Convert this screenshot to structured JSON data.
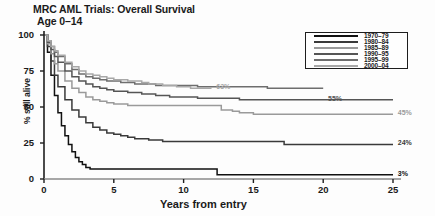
{
  "chart_data": {
    "type": "line",
    "title": "MRC AML Trials: Overall Survival",
    "subtitle": "Age 0–14",
    "xlabel": "Years from entry",
    "ylabel": "% still alive",
    "xlim": [
      0,
      25
    ],
    "ylim": [
      0,
      100
    ],
    "xticks": [
      "0",
      "5",
      "10",
      "15",
      "20",
      "25"
    ],
    "yticks": [
      "0",
      "25",
      "50",
      "75",
      "100"
    ],
    "grid": false,
    "legend_position": "top-right",
    "curve_type": "kaplan-meier-step",
    "legend": [
      "1970–79",
      "1980–84",
      "1985–89",
      "1990–95",
      "1995–99",
      "2000–04"
    ],
    "series": [
      {
        "name": "1970–79",
        "color": "#111111",
        "end_label": "3%",
        "end_value": 3,
        "points": [
          [
            0,
            100
          ],
          [
            0.25,
            88
          ],
          [
            0.5,
            72
          ],
          [
            0.75,
            58
          ],
          [
            1,
            46
          ],
          [
            1.25,
            37
          ],
          [
            1.5,
            30
          ],
          [
            1.75,
            24
          ],
          [
            2,
            19
          ],
          [
            2.25,
            15
          ],
          [
            2.5,
            12
          ],
          [
            2.75,
            10
          ],
          [
            3,
            8
          ],
          [
            3.3,
            7
          ],
          [
            4,
            7
          ],
          [
            5,
            7
          ],
          [
            6,
            7
          ],
          [
            7,
            7
          ],
          [
            8,
            7
          ],
          [
            9,
            7
          ],
          [
            10,
            7
          ],
          [
            11,
            7
          ],
          [
            12,
            7
          ],
          [
            12.4,
            3
          ],
          [
            14,
            3
          ],
          [
            16,
            3
          ],
          [
            18,
            3
          ],
          [
            20,
            3
          ],
          [
            22,
            3
          ],
          [
            24,
            3
          ],
          [
            25,
            3
          ]
        ]
      },
      {
        "name": "1980–84",
        "color": "#3a3a3a",
        "end_label": "24%",
        "end_value": 24,
        "points": [
          [
            0,
            100
          ],
          [
            0.25,
            92
          ],
          [
            0.5,
            82
          ],
          [
            0.75,
            72
          ],
          [
            1,
            64
          ],
          [
            1.5,
            55
          ],
          [
            2,
            48
          ],
          [
            2.5,
            43
          ],
          [
            3,
            39
          ],
          [
            3.5,
            36
          ],
          [
            4,
            34
          ],
          [
            4.5,
            32
          ],
          [
            5,
            31
          ],
          [
            5.5,
            30
          ],
          [
            6,
            29
          ],
          [
            6.5,
            28
          ],
          [
            7,
            28
          ],
          [
            7.5,
            27
          ],
          [
            8,
            27
          ],
          [
            8.5,
            26
          ],
          [
            9,
            26
          ],
          [
            10,
            26
          ],
          [
            11,
            26
          ],
          [
            12,
            26
          ],
          [
            13,
            26
          ],
          [
            14,
            26
          ],
          [
            15,
            26
          ],
          [
            16,
            26
          ],
          [
            17,
            26
          ],
          [
            17.2,
            24
          ],
          [
            19,
            24
          ],
          [
            21,
            24
          ],
          [
            23,
            24
          ],
          [
            25,
            24
          ]
        ]
      },
      {
        "name": "1985–89",
        "color": "#9a9a9a",
        "end_label": "45%",
        "end_value": 45,
        "points": [
          [
            0,
            100
          ],
          [
            0.25,
            94
          ],
          [
            0.5,
            87
          ],
          [
            0.75,
            80
          ],
          [
            1,
            75
          ],
          [
            1.5,
            68
          ],
          [
            2,
            63
          ],
          [
            2.5,
            60
          ],
          [
            3,
            57
          ],
          [
            3.5,
            55
          ],
          [
            4,
            54
          ],
          [
            4.5,
            53
          ],
          [
            5,
            52
          ],
          [
            5.5,
            52
          ],
          [
            6,
            51
          ],
          [
            7,
            51
          ],
          [
            8,
            51
          ],
          [
            9,
            51
          ],
          [
            10,
            51
          ],
          [
            11,
            51
          ],
          [
            12,
            51
          ],
          [
            12.5,
            51
          ],
          [
            12.7,
            48
          ],
          [
            13,
            48
          ],
          [
            13.5,
            47
          ],
          [
            14,
            46
          ],
          [
            14.5,
            46
          ],
          [
            15,
            45
          ],
          [
            16,
            45
          ],
          [
            18,
            45
          ],
          [
            20,
            45
          ],
          [
            22,
            45
          ],
          [
            24,
            45
          ],
          [
            25,
            45
          ]
        ]
      },
      {
        "name": "1990–95",
        "color": "#555555",
        "end_label": "55%",
        "end_value": 55,
        "points": [
          [
            0,
            100
          ],
          [
            0.25,
            95
          ],
          [
            0.5,
            90
          ],
          [
            0.75,
            85
          ],
          [
            1,
            81
          ],
          [
            1.5,
            75
          ],
          [
            2,
            71
          ],
          [
            2.5,
            68
          ],
          [
            3,
            66
          ],
          [
            3.5,
            64
          ],
          [
            4,
            63
          ],
          [
            4.5,
            62
          ],
          [
            5,
            61
          ],
          [
            5.5,
            61
          ],
          [
            6,
            60
          ],
          [
            6.5,
            60
          ],
          [
            7,
            59
          ],
          [
            7.5,
            59
          ],
          [
            8,
            58
          ],
          [
            8.5,
            58
          ],
          [
            9,
            57
          ],
          [
            9.5,
            57
          ],
          [
            10,
            57
          ],
          [
            10.5,
            57
          ],
          [
            11,
            56
          ],
          [
            12,
            56
          ],
          [
            13,
            56
          ],
          [
            14,
            55
          ],
          [
            15,
            55
          ],
          [
            16,
            55
          ],
          [
            17,
            55
          ],
          [
            18,
            55
          ],
          [
            19,
            55
          ],
          [
            20,
            55
          ],
          [
            22,
            55
          ],
          [
            24,
            55
          ],
          [
            25,
            55
          ]
        ]
      },
      {
        "name": "1995–99",
        "color": "#6e6e6e",
        "end_label": "",
        "end_value": 63,
        "points": [
          [
            0,
            100
          ],
          [
            0.25,
            96
          ],
          [
            0.5,
            92
          ],
          [
            0.75,
            88
          ],
          [
            1,
            85
          ],
          [
            1.5,
            80
          ],
          [
            2,
            76
          ],
          [
            2.5,
            73
          ],
          [
            3,
            71
          ],
          [
            3.5,
            70
          ],
          [
            4,
            69
          ],
          [
            4.5,
            68
          ],
          [
            5,
            68
          ],
          [
            5.5,
            67
          ],
          [
            6,
            67
          ],
          [
            6.5,
            66
          ],
          [
            7,
            66
          ],
          [
            7.5,
            66
          ],
          [
            8,
            65
          ],
          [
            8.5,
            65
          ],
          [
            9,
            65
          ],
          [
            9.5,
            65
          ],
          [
            10,
            65
          ],
          [
            11,
            64
          ],
          [
            12,
            64
          ],
          [
            13,
            64
          ],
          [
            14,
            64
          ],
          [
            15,
            64
          ],
          [
            16,
            63
          ],
          [
            17,
            63
          ],
          [
            18,
            63
          ],
          [
            19,
            63
          ],
          [
            20,
            63
          ]
        ]
      },
      {
        "name": "2000–04",
        "color": "#a8a8a8",
        "end_label": "63%",
        "end_value": 63,
        "points": [
          [
            0,
            100
          ],
          [
            0.25,
            96
          ],
          [
            0.5,
            92
          ],
          [
            0.75,
            89
          ],
          [
            1,
            86
          ],
          [
            1.5,
            81
          ],
          [
            2,
            78
          ],
          [
            2.5,
            75
          ],
          [
            3,
            73
          ],
          [
            3.5,
            72
          ],
          [
            4,
            71
          ],
          [
            4.5,
            70
          ],
          [
            5,
            69
          ],
          [
            5.5,
            69
          ],
          [
            6,
            68
          ],
          [
            6.5,
            68
          ],
          [
            7,
            67
          ],
          [
            7.5,
            66
          ],
          [
            8,
            66
          ],
          [
            8.5,
            65
          ],
          [
            9,
            65
          ],
          [
            9.5,
            64
          ],
          [
            10,
            64
          ],
          [
            10.5,
            63
          ],
          [
            11,
            63
          ],
          [
            11.5,
            63
          ],
          [
            12,
            63
          ]
        ]
      }
    ],
    "annotations": [
      {
        "text": "63%",
        "x": 12.2,
        "y": 63
      },
      {
        "text": "55%",
        "x": 20.2,
        "y": 55
      },
      {
        "text": "45%",
        "x": 25.2,
        "y": 45
      },
      {
        "text": "24%",
        "x": 25.2,
        "y": 24
      },
      {
        "text": "3%",
        "x": 25.2,
        "y": 3
      }
    ]
  },
  "colors": {
    "axis": "#1d1d1d",
    "text": "#1a1a1a",
    "background": "#fdfdfd"
  }
}
